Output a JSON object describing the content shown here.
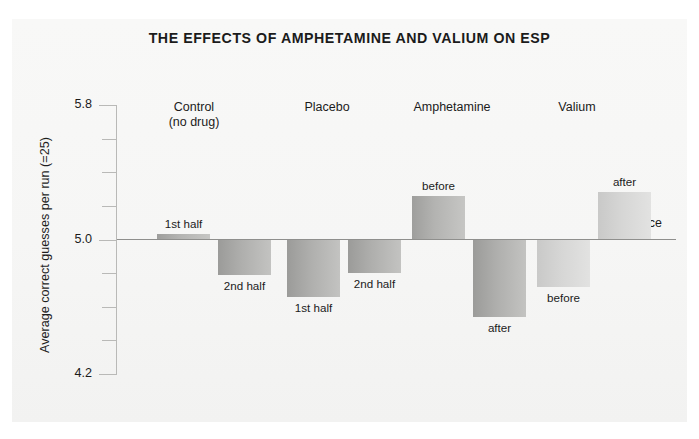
{
  "figure": {
    "title": "THE EFFECTS OF AMPHETAMINE AND VALIUM ON ESP",
    "background_color": "#f7f7f6",
    "bar_color": "#b0b0ae",
    "axis_color": "#b9b9b7",
    "zero_line_color": "#8f8f8d",
    "text_color": "#1b1b1b"
  },
  "chart_data": {
    "type": "bar",
    "title": "THE EFFECTS OF AMPHETAMINE AND VALIUM ON ESP",
    "xlabel": "",
    "ylabel": "Average correct guesses per run (=25)",
    "ylim": [
      4.2,
      5.8
    ],
    "ytick_labels": [
      "5.8",
      "5.0",
      "4.2"
    ],
    "ytick_values": [
      5.8,
      5.0,
      4.2
    ],
    "minor_tick_values": [
      5.6,
      5.4,
      5.2,
      4.8,
      4.6,
      4.4
    ],
    "grid": false,
    "legend": "none",
    "baseline": {
      "value": 5.0,
      "label": "chance"
    },
    "groups": [
      {
        "name": "Control",
        "sublabel": "(no drug)",
        "bars": [
          {
            "label": "1st half",
            "value": 5.03,
            "direction": "up",
            "shade": "mid"
          },
          {
            "label": "2nd half",
            "value": 4.79,
            "direction": "down",
            "shade": "mid"
          }
        ]
      },
      {
        "name": "Placebo",
        "sublabel": "",
        "bars": [
          {
            "label": "1st half",
            "value": 4.66,
            "direction": "down",
            "shade": "mid"
          },
          {
            "label": "2nd half",
            "value": 4.8,
            "direction": "down",
            "shade": "mid"
          }
        ]
      },
      {
        "name": "Amphetamine",
        "sublabel": "",
        "bars": [
          {
            "label": "before",
            "value": 5.26,
            "direction": "up",
            "shade": "mid"
          },
          {
            "label": "after",
            "value": 4.54,
            "direction": "down",
            "shade": "mid"
          }
        ]
      },
      {
        "name": "Valium",
        "sublabel": "",
        "bars": [
          {
            "label": "before",
            "value": 4.72,
            "direction": "down",
            "shade": "light"
          },
          {
            "label": "after",
            "value": 5.28,
            "direction": "up",
            "shade": "light"
          }
        ]
      }
    ]
  }
}
